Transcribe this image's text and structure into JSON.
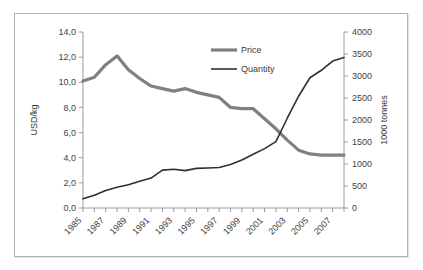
{
  "chart_data": {
    "type": "line",
    "title": "",
    "xlabel": "",
    "ylabel": "USD/kg",
    "y2label": "1000 tonnes",
    "grid": false,
    "legend_position": "top-center",
    "ylim": [
      0,
      14
    ],
    "y2lim": [
      0,
      4000
    ],
    "ytick_labels": [
      "0,0",
      "2,0",
      "4,0",
      "6,0",
      "8,0",
      "10,0",
      "12,0",
      "14,0"
    ],
    "ytick_values": [
      0,
      2,
      4,
      6,
      8,
      10,
      12,
      14
    ],
    "y2tick_labels": [
      "0",
      "500",
      "1000",
      "1500",
      "2000",
      "2500",
      "3000",
      "3500",
      "4000"
    ],
    "y2tick_values": [
      0,
      500,
      1000,
      1500,
      2000,
      2500,
      3000,
      3500,
      4000
    ],
    "x": [
      1985,
      1986,
      1987,
      1988,
      1989,
      1990,
      1991,
      1992,
      1993,
      1994,
      1995,
      1996,
      1997,
      1998,
      1999,
      2000,
      2001,
      2002,
      2003,
      2004,
      2005,
      2006,
      2007,
      2008
    ],
    "xtick_labels": [
      "1985",
      "1987",
      "1989",
      "1991",
      "1993",
      "1995",
      "1997",
      "1999",
      "2001",
      "2003",
      "2005",
      "2007"
    ],
    "xtick_values": [
      1985,
      1987,
      1989,
      1991,
      1993,
      1995,
      1997,
      1999,
      2001,
      2003,
      2005,
      2007
    ],
    "series": [
      {
        "name": "Price",
        "axis": "left",
        "units": "USD/kg",
        "color": "#808080",
        "line_width": 3.2,
        "values": [
          10.1,
          10.4,
          11.4,
          12.1,
          11.0,
          10.3,
          9.7,
          9.5,
          9.3,
          9.5,
          9.2,
          9.0,
          8.8,
          8.0,
          7.9,
          7.9,
          7.1,
          6.3,
          5.4,
          4.6,
          4.3,
          4.2,
          4.2,
          4.2
        ]
      },
      {
        "name": "Quantity",
        "axis": "right",
        "units": "1000 tonnes",
        "color": "#2f2f2f",
        "line_width": 1.6,
        "values": [
          210,
          290,
          400,
          470,
          530,
          610,
          680,
          860,
          880,
          850,
          900,
          910,
          920,
          990,
          1090,
          1220,
          1350,
          1510,
          2040,
          2540,
          2960,
          3130,
          3340,
          3420
        ]
      }
    ],
    "legend": [
      {
        "label": "Price",
        "color": "#808080",
        "line_width": 3.2
      },
      {
        "label": "Quantity",
        "color": "#2f2f2f",
        "line_width": 1.6
      }
    ]
  },
  "colors": {
    "price": "#808080",
    "quantity": "#2f2f2f",
    "axis": "#9a9a9a",
    "text": "#3f3f3f",
    "frame_border": "#b5b5b5",
    "background": "#ffffff"
  }
}
